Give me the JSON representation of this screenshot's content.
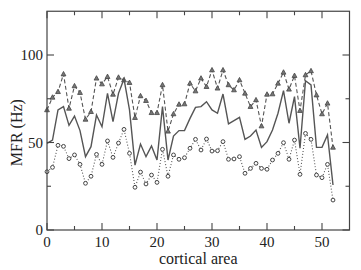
{
  "chart_data": {
    "type": "line",
    "title": "",
    "xlabel": "cortical area",
    "ylabel": "MFR (Hz)",
    "xlim": [
      0,
      55
    ],
    "ylim": [
      0,
      125
    ],
    "x_major_ticks": [
      0,
      10,
      20,
      30,
      40,
      50
    ],
    "x_minor_ticks": [
      5,
      15,
      25,
      35,
      45
    ],
    "y_major_ticks": [
      0,
      50,
      100
    ],
    "y_minor_ticks": [
      25,
      75
    ],
    "x_tick_labels": [
      "0",
      "10",
      "20",
      "30",
      "40",
      "50"
    ],
    "y_tick_labels": [
      "0",
      "50",
      "100"
    ],
    "grid": false,
    "legend": null,
    "x": [
      0,
      1,
      2,
      3,
      4,
      5,
      6,
      7,
      8,
      9,
      10,
      11,
      12,
      13,
      14,
      15,
      16,
      17,
      18,
      19,
      20,
      21,
      22,
      23,
      24,
      25,
      26,
      27,
      28,
      29,
      30,
      31,
      32,
      33,
      34,
      35,
      36,
      37,
      38,
      39,
      40,
      41,
      42,
      43,
      44,
      45,
      46,
      47,
      48,
      49,
      50,
      51,
      52
    ],
    "series": [
      {
        "name": "upper (triangles, dashed)",
        "style": "dashed",
        "marker": "triangle",
        "color": "#555555",
        "values": [
          68.6,
          75.8,
          79,
          89.1,
          69.5,
          82.3,
          78.5,
          63.2,
          67.6,
          86.7,
          83.4,
          87.6,
          77.5,
          87.2,
          85.7,
          84.2,
          64.2,
          76.6,
          73.9,
          67,
          67,
          82.9,
          56.4,
          66.3,
          71.8,
          72,
          83.8,
          79.4,
          86.7,
          81.9,
          91.4,
          81,
          91.4,
          82.9,
          80,
          85.7,
          78.1,
          70.5,
          74.3,
          59.4,
          77.5,
          77.7,
          83.8,
          90.1,
          80.4,
          88.2,
          68.2,
          88.6,
          90.9,
          77.1,
          66.3,
          72.4,
          47.2
        ]
      },
      {
        "name": "middle (solid)",
        "style": "solid",
        "marker": "none",
        "color": "#555555",
        "values": [
          49.5,
          51.4,
          68.6,
          70.5,
          59.8,
          65.1,
          56.8,
          41.9,
          47.6,
          65.7,
          59,
          78.1,
          61.9,
          78.1,
          86.3,
          68.6,
          37.1,
          49.1,
          41.9,
          48,
          40,
          70.5,
          40,
          53.7,
          56.8,
          56.8,
          63.8,
          70.1,
          70.5,
          73.3,
          68.6,
          66.7,
          77.7,
          60.6,
          62.5,
          64.4,
          51.8,
          53.7,
          57.1,
          47.2,
          50.5,
          57.1,
          66.7,
          79.6,
          61,
          76.2,
          46.7,
          85.3,
          82.9,
          47.2,
          47.2,
          54.3,
          25.7
        ]
      },
      {
        "name": "lower (circles, dotted)",
        "style": "dotted",
        "marker": "circle",
        "color": "#555555",
        "values": [
          33.3,
          35.8,
          48.4,
          47.8,
          40.8,
          42.9,
          37.5,
          26.7,
          30.7,
          43.2,
          37.5,
          50.9,
          41.5,
          49.7,
          57.5,
          43.8,
          24.4,
          33.1,
          26.3,
          31.4,
          27.2,
          46.1,
          30.7,
          42.9,
          40.4,
          41.3,
          46.7,
          51.8,
          45.7,
          52,
          45.1,
          45.3,
          50.5,
          40.4,
          40.6,
          41.9,
          32.4,
          35.2,
          38.1,
          35.2,
          34.7,
          40,
          43.8,
          49.9,
          40.4,
          51.4,
          31.8,
          55.2,
          51.8,
          31.4,
          29.9,
          37.5,
          17.1
        ]
      }
    ]
  }
}
